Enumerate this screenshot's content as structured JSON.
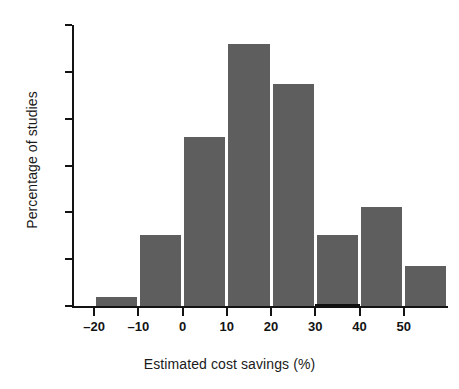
{
  "chart_data": {
    "type": "bar",
    "title": "",
    "subtitle": "",
    "xlabel": "Estimated cost savings (%)",
    "ylabel": "Percentage of studies",
    "grid": false,
    "legend": false,
    "bin_edges": [
      -20,
      -10,
      0,
      10,
      20,
      30,
      40,
      50,
      60
    ],
    "categories": [
      "-20 to -10",
      "-10 to 0",
      "0 to 10",
      "10 to 20",
      "20 to 30",
      "30 to 40",
      "40 to 50",
      "50 to 60"
    ],
    "values": [
      1.0,
      7.6,
      18.0,
      28.0,
      23.7,
      7.6,
      10.6,
      4.3
    ],
    "xlim": [
      -25,
      60
    ],
    "ylim": [
      0,
      30
    ],
    "xticks": [
      -20,
      -10,
      0,
      10,
      20,
      30,
      40,
      50
    ],
    "xticklabels": [
      "–20",
      "–10",
      "0",
      "10",
      "20",
      "30",
      "40",
      "50"
    ],
    "yticks": [
      0,
      5,
      10,
      15,
      20,
      25,
      30
    ],
    "yticklabels": [
      "0",
      "5",
      "10",
      "15",
      "20",
      "25",
      "30"
    ],
    "bar_color": "#5e5e5e",
    "axis_color": "#131313",
    "background": "#ffffff"
  }
}
